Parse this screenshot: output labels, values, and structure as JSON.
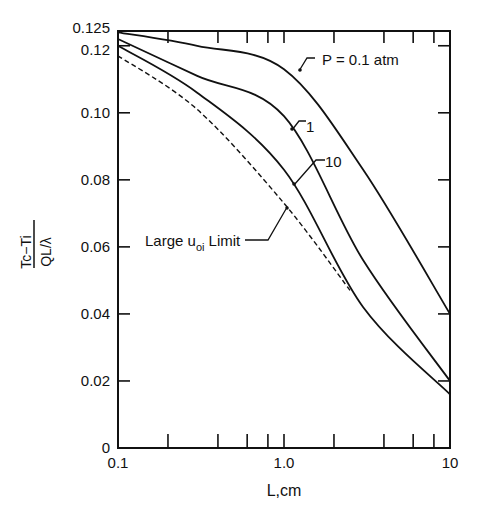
{
  "chart_data": {
    "type": "line",
    "title": "",
    "xlabel": "L,cm",
    "ylabel": "(Tc−Ti)/(QL/λ)",
    "ylabel_numerator": "Tc−Ti",
    "ylabel_denominator": "QL/λ",
    "xscale": "log",
    "xlim": [
      0.1,
      10
    ],
    "ylim": [
      0,
      0.125
    ],
    "x_tick_labels": [
      "0.1",
      "1.0",
      "10"
    ],
    "y_tick_labels": [
      "0",
      "0.02",
      "0.04",
      "0.06",
      "0.08",
      "0.10",
      "0.12",
      "0.125"
    ],
    "y_ticks": [
      0,
      0.02,
      0.04,
      0.06,
      0.08,
      0.1,
      0.12,
      0.125
    ],
    "grid": false,
    "series": [
      {
        "name": "P = 0.1 atm",
        "style": "solid",
        "x": [
          0.1,
          0.3,
          1.0,
          3.0,
          10
        ],
        "y": [
          0.124,
          0.12,
          0.113,
          0.083,
          0.04
        ]
      },
      {
        "name": "1",
        "style": "solid",
        "x": [
          0.1,
          0.3,
          1.0,
          3.0,
          10
        ],
        "y": [
          0.122,
          0.111,
          0.099,
          0.056,
          0.02
        ]
      },
      {
        "name": "10",
        "style": "solid",
        "x": [
          0.1,
          0.3,
          1.0,
          3.0,
          10
        ],
        "y": [
          0.12,
          0.106,
          0.083,
          0.042,
          0.016
        ]
      },
      {
        "name": "Large u_oi Limit",
        "style": "dashed",
        "x": [
          0.1,
          0.3,
          1.0,
          2.5
        ],
        "y": [
          0.117,
          0.101,
          0.073,
          0.047
        ]
      }
    ],
    "annotations": [
      {
        "text": "P = 0.1 atm",
        "target_series": "P = 0.1 atm"
      },
      {
        "text": "1",
        "target_series": "1"
      },
      {
        "text": "10",
        "target_series": "10"
      },
      {
        "text": "Large u",
        "subscript": "oi",
        "suffix": " Limit",
        "target_series": "Large u_oi Limit"
      }
    ]
  }
}
